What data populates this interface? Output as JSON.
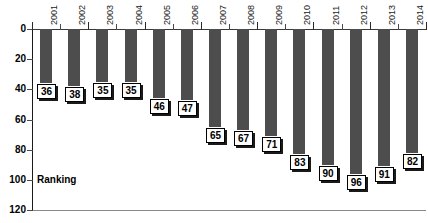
{
  "chart_data": {
    "type": "bar",
    "title": "",
    "xlabel": "",
    "ylabel": "Ranking",
    "categories": [
      "2001",
      "2002",
      "2003",
      "2004",
      "2005",
      "2006",
      "2007",
      "2008",
      "2009",
      "2010",
      "2011",
      "2012",
      "2013",
      "2014"
    ],
    "values": [
      36,
      38,
      35,
      35,
      46,
      47,
      65,
      67,
      71,
      83,
      90,
      96,
      91,
      82
    ],
    "ylim": [
      0,
      120
    ],
    "y_inverted": true,
    "y_ticks": [
      0,
      20,
      40,
      60,
      80,
      100,
      120
    ],
    "y_tick_labels": [
      "0",
      "20",
      "40",
      "60",
      "80",
      "100",
      "120"
    ],
    "grid": false,
    "legend": null,
    "data_labels_shown": true,
    "bar_color": "#4d4d4d",
    "label_box_fill": "#ffffff",
    "label_box_border": "#000000",
    "axis_color": "#1a1a1a",
    "x_tick_label_rotation": -90,
    "data_points": [
      {
        "category": "2001",
        "value": 36
      },
      {
        "category": "2002",
        "value": 38
      },
      {
        "category": "2003",
        "value": 35
      },
      {
        "category": "2004",
        "value": 35
      },
      {
        "category": "2005",
        "value": 46
      },
      {
        "category": "2006",
        "value": 47
      },
      {
        "category": "2007",
        "value": 65
      },
      {
        "category": "2008",
        "value": 67
      },
      {
        "category": "2009",
        "value": 71
      },
      {
        "category": "2010",
        "value": 83
      },
      {
        "category": "2011",
        "value": 90
      },
      {
        "category": "2012",
        "value": 96
      },
      {
        "category": "2013",
        "value": 91
      },
      {
        "category": "2014",
        "value": 82
      }
    ]
  },
  "axis": {
    "y_caption": "Ranking"
  }
}
